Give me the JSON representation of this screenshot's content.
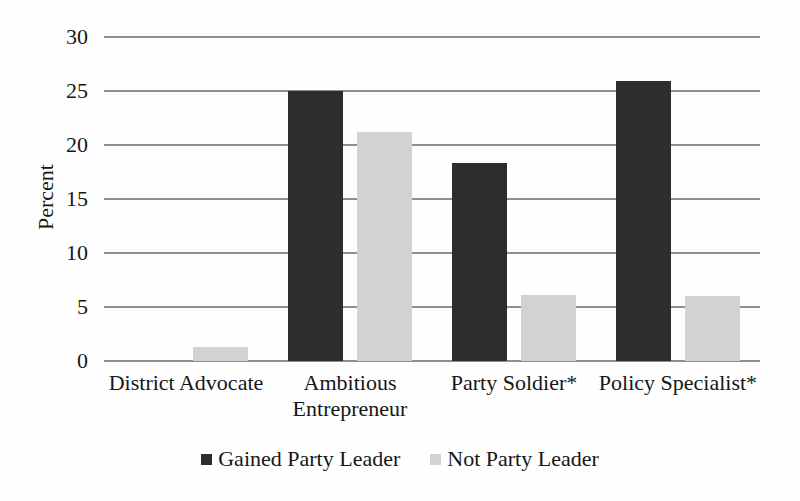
{
  "figure": {
    "background": "#fefefe",
    "text_color": "#161616",
    "gridline_color": "#8f8f8f"
  },
  "chart_data": {
    "type": "bar",
    "title": "",
    "xlabel": "",
    "ylabel": "Percent",
    "ylim": [
      0,
      30
    ],
    "yticks": [
      0,
      5,
      10,
      15,
      20,
      25,
      30
    ],
    "grid": true,
    "legend_position": "bottom",
    "categories": [
      "District Advocate",
      "Ambitious Entrepreneur",
      "Party Soldier*",
      "Policy Specialist*"
    ],
    "series": [
      {
        "name": "Gained Party Leader",
        "color": "#2d2d2d",
        "values": [
          0,
          25,
          18.3,
          25.9
        ]
      },
      {
        "name": "Not Party Leader",
        "color": "#d2d2d2",
        "values": [
          1.3,
          21.2,
          6.1,
          6.0
        ]
      }
    ]
  }
}
